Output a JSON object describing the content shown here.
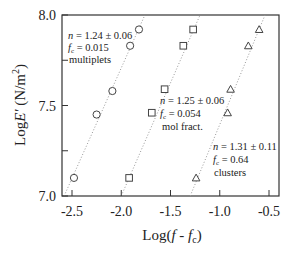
{
  "chart_data": {
    "type": "scatter",
    "title": "",
    "xlabel": "Log(f - f_c)",
    "xlabel_parts": {
      "pre": "Log(",
      "f": "f",
      "mid": " - ",
      "f2": "f",
      "sub": "c",
      "post": ")"
    },
    "ylabel": "LogE' (N/m^2)",
    "ylabel_parts": {
      "pre": "Log",
      "E": "E'",
      "unit": " (N/m",
      "sup": "2",
      "post": ")"
    },
    "xlim": [
      -2.6,
      -0.45
    ],
    "ylim": [
      7.0,
      8.0
    ],
    "x_ticks": [
      -2.5,
      -2.0,
      -1.5,
      -1.0,
      -0.5
    ],
    "x_tick_labels": [
      "-2.5",
      "-2.0",
      "-1.5",
      "-1.0",
      "-0.5"
    ],
    "y_ticks": [
      7.0,
      7.25,
      7.5,
      7.75,
      8.0
    ],
    "y_tick_labels": [
      "7.0",
      "",
      "7.5",
      "",
      "8.0"
    ],
    "grid": false,
    "series": [
      {
        "name": "multiplets",
        "marker": "circle",
        "x": [
          -2.48,
          -2.25,
          -2.09,
          -1.91,
          -1.82
        ],
        "y": [
          7.1,
          7.45,
          7.58,
          7.83,
          7.92
        ],
        "fit_line": {
          "x": [
            -2.58,
            -1.76
          ],
          "y": [
            7.0,
            8.0
          ]
        },
        "annotation": {
          "n": "n = 1.24 ± 0.06",
          "fc": "= 0.015",
          "label": "multiplets"
        }
      },
      {
        "name": "mol fract.",
        "marker": "square",
        "x": [
          -1.92,
          -1.69,
          -1.56,
          -1.37,
          -1.27
        ],
        "y": [
          7.1,
          7.46,
          7.59,
          7.83,
          7.92
        ],
        "fit_line": {
          "x": [
            -2.0,
            -1.2
          ],
          "y": [
            7.0,
            8.0
          ]
        },
        "annotation": {
          "n": "n = 1.25 ± 0.06",
          "fc": "= 0.054",
          "label": "mol  fract."
        }
      },
      {
        "name": "clusters",
        "marker": "triangle",
        "x": [
          -1.24,
          -0.92,
          -0.89,
          -0.71,
          -0.6
        ],
        "y": [
          7.1,
          7.46,
          7.59,
          7.83,
          7.92
        ],
        "fit_line": {
          "x": [
            -1.3,
            -0.54
          ],
          "y": [
            7.0,
            8.0
          ]
        },
        "annotation": {
          "n": "n = 1.31 ± 0.11",
          "fc": "= 0.64",
          "label": "clusters"
        }
      }
    ],
    "legend": "none (inline annotations)"
  }
}
